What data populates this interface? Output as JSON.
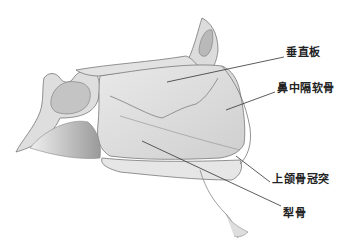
{
  "diagram": {
    "labels": [
      {
        "id": "perpendicular-plate",
        "text": "垂直板",
        "x": 286,
        "y": 50
      },
      {
        "id": "septal-cartilage",
        "text": "鼻中隔软骨",
        "x": 277,
        "y": 85
      },
      {
        "id": "maxillary-crest",
        "text": "上颌骨冠突",
        "x": 272,
        "y": 176
      },
      {
        "id": "vomer",
        "text": "犁骨",
        "x": 283,
        "y": 212
      }
    ]
  }
}
